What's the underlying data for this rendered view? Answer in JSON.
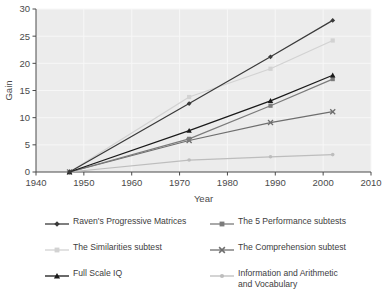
{
  "chart_data": {
    "type": "line",
    "title": "",
    "xlabel": "Year",
    "ylabel": "Gain",
    "xlim": [
      1940,
      2010
    ],
    "ylim": [
      0,
      30
    ],
    "xticks": [
      1940,
      1950,
      1960,
      1970,
      1980,
      1990,
      2000,
      2010
    ],
    "yticks": [
      0,
      5,
      10,
      15,
      20,
      25,
      30
    ],
    "grid": true,
    "legend_position": "below",
    "x": [
      1947,
      1972,
      1989,
      2002
    ],
    "series": [
      {
        "name": "Raven's Progressive Matrices",
        "values": [
          0,
          12.6,
          21.2,
          27.9
        ],
        "color": "#3a3a3a",
        "marker": "diamond"
      },
      {
        "name": "The 5 Performance subtests",
        "values": [
          0,
          6.1,
          12.2,
          17.1
        ],
        "color": "#7b7b7b",
        "marker": "square"
      },
      {
        "name": "The Similarities subtest",
        "values": [
          0,
          13.8,
          19.0,
          24.2
        ],
        "color": "#d2d2d2",
        "marker": "square"
      },
      {
        "name": "The Comprehension subtest",
        "values": [
          0,
          5.8,
          9.1,
          11.1
        ],
        "color": "#6e6e6e",
        "marker": "x"
      },
      {
        "name": "Full Scale IQ",
        "values": [
          0,
          7.6,
          13.1,
          17.8
        ],
        "color": "#1a1a1a",
        "marker": "triangle"
      },
      {
        "name": "Information and Arithmetic\nand Vocabulary",
        "values": [
          0,
          2.2,
          2.8,
          3.2
        ],
        "color": "#bdbdbd",
        "marker": "dot"
      }
    ]
  },
  "axes": {
    "y_label": "Gain",
    "x_label": "Year",
    "x_tick_labels": [
      "1940",
      "1950",
      "1960",
      "1970",
      "1980",
      "1990",
      "2000",
      "2010"
    ],
    "y_tick_labels": [
      "0",
      "5",
      "10",
      "15",
      "20",
      "25",
      "30"
    ]
  },
  "legend": {
    "items": [
      {
        "label": "Raven's Progressive Matrices",
        "color": "#3a3a3a",
        "marker": "diamond"
      },
      {
        "label": "The 5 Performance subtests",
        "color": "#7b7b7b",
        "marker": "square"
      },
      {
        "label": "The Similarities subtest",
        "color": "#d2d2d2",
        "marker": "square"
      },
      {
        "label": "The Comprehension subtest",
        "color": "#6e6e6e",
        "marker": "x"
      },
      {
        "label": "Full Scale IQ",
        "color": "#1a1a1a",
        "marker": "triangle"
      },
      {
        "label": "Information and Arithmetic\nand Vocabulary",
        "color": "#bdbdbd",
        "marker": "dot"
      }
    ]
  },
  "style": {
    "plot_background": "#ececec",
    "grid_color": "#f7f7f7",
    "axis_color": "#4a4a4a",
    "page_background": "#ffffff"
  }
}
